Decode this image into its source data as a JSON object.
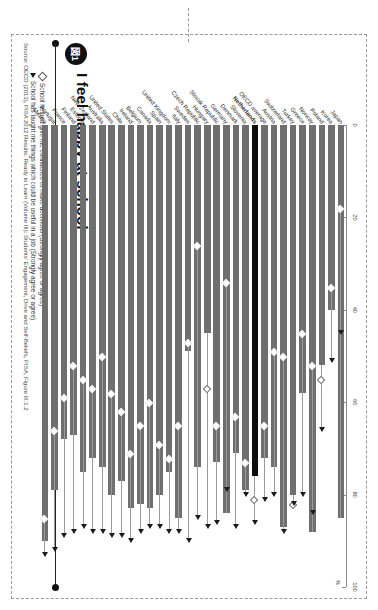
{
  "figure": {
    "badge": "図1",
    "title": "I feel happy at school",
    "source": "Source: OECD (2013), PISA 2012 Results: Ready to Learn (Volume III): Students' Engagement, Drive and Self-Beliefs, PISA, Figure III.1.2",
    "legend": [
      {
        "marker": "diamond-marker",
        "label": "School helped give me confidence to make decisions (Strongly agree or agree)"
      },
      {
        "marker": "triangle-marker",
        "label": "School has taught me things which could be useful in a job (Strongly agree or agree)"
      }
    ]
  },
  "chart_data": {
    "type": "bar",
    "title": "I feel happy at school",
    "xlabel": "%",
    "ylabel": "",
    "xlim": [
      0,
      100
    ],
    "ticks": [
      0,
      20,
      40,
      60,
      80,
      100
    ],
    "tick_labels": [
      "0",
      "20",
      "40",
      "60",
      "80",
      "100"
    ],
    "grid": false,
    "legend_position": "below-title",
    "highlight_category": "Netherlands",
    "axis_unit": "%",
    "categories": [
      "Japan",
      "Korea",
      "Poland",
      "Norway",
      "Greece",
      "Turkey",
      "Switzerland",
      "Austria",
      "OECD average",
      "Netherlands",
      "Slovenia",
      "Denmark",
      "Germany",
      "Slovak Republic",
      "Hungary",
      "Czech Republic",
      "Sweden",
      "Italy",
      "United Kingdom",
      "Spain",
      "Canada",
      "Belgium",
      "Ireland",
      "Chile",
      "United States",
      "Australia",
      "New Zealand",
      "Estonia",
      "Finland",
      "France",
      "Portugal",
      "Mexico"
    ],
    "series": [
      {
        "name": "I feel happy at school (Strongly agree or agree)",
        "type": "bar",
        "values": [
          85,
          40,
          52,
          88,
          58,
          80,
          87,
          74,
          72,
          76,
          79,
          71,
          84,
          73,
          45,
          74,
          49,
          85,
          75,
          80,
          83,
          82,
          83,
          77,
          80,
          74,
          72,
          75,
          67,
          68,
          79,
          90
        ]
      },
      {
        "name": "School helped give me confidence to make decisions (Strongly agree or agree)",
        "type": "diamond",
        "values": [
          18,
          35,
          55,
          52,
          45,
          82,
          50,
          49,
          65,
          81,
          73,
          63,
          34,
          65,
          57,
          26,
          47,
          65,
          72,
          69,
          60,
          65,
          71,
          62,
          58,
          50,
          57,
          55,
          52,
          59,
          66,
          85
        ]
      },
      {
        "name": "School has taught me things which could be useful in a job (Strongly agree or agree)",
        "type": "triangle",
        "values": [
          45,
          51,
          66,
          84,
          80,
          82,
          88,
          80,
          81,
          86,
          80,
          87,
          79,
          86,
          87,
          85,
          90,
          88,
          88,
          87,
          87,
          88,
          90,
          89,
          89,
          88,
          88,
          87,
          88,
          89,
          92,
          93
        ]
      }
    ]
  }
}
